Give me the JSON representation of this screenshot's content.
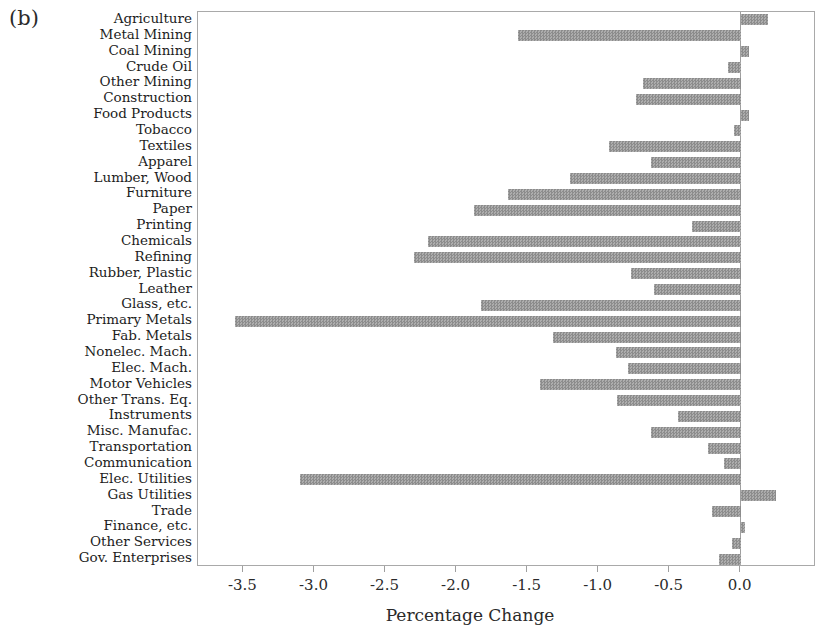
{
  "panel_label": "(b)",
  "chart_data": {
    "type": "bar",
    "orientation": "horizontal",
    "title": "",
    "xlabel": "Percentage Change",
    "ylabel": "",
    "xlim": [
      -3.82,
      0.53
    ],
    "grid": false,
    "legend": "none",
    "categories": [
      "Agriculture",
      "Metal Mining",
      "Coal Mining",
      "Crude Oil",
      "Other Mining",
      "Construction",
      "Food Products",
      "Tobacco",
      "Textiles",
      "Apparel",
      "Lumber, Wood",
      "Furniture",
      "Paper",
      "Printing",
      "Chemicals",
      "Refining",
      "Rubber, Plastic",
      "Leather",
      "Glass, etc.",
      "Primary Metals",
      "Fab. Metals",
      "Nonelec. Mach.",
      "Elec. Mach.",
      "Motor Vehicles",
      "Other Trans. Eq.",
      "Instruments",
      "Misc. Manufac.",
      "Transportation",
      "Communication",
      "Elec. Utilities",
      "Gas Utilities",
      "Trade",
      "Finance, etc.",
      "Other Services",
      "Gov. Enterprises"
    ],
    "values": [
      0.19,
      -1.57,
      0.06,
      -0.09,
      -0.69,
      -0.74,
      0.06,
      -0.05,
      -0.93,
      -0.63,
      -1.2,
      -1.64,
      -1.88,
      -0.34,
      -2.2,
      -2.3,
      -0.77,
      -0.61,
      -1.83,
      -3.56,
      -1.32,
      -0.88,
      -0.79,
      -1.41,
      -0.87,
      -0.44,
      -0.63,
      -0.23,
      -0.12,
      -3.1,
      0.25,
      -0.2,
      0.03,
      -0.06,
      -0.15
    ],
    "x_ticks": [
      -3.5,
      -3.0,
      -2.5,
      -2.0,
      -1.5,
      -1.0,
      -0.5,
      0.0
    ],
    "x_tick_labels": [
      "-3.5",
      "-3.0",
      "-2.5",
      "-2.0",
      "-1.5",
      "-1.0",
      "-0.5",
      "0.0"
    ],
    "bar_color": "#9a9a9a",
    "bar_pattern_dark": "#8c8c8c",
    "bar_pattern_light": "#adadad",
    "frame_color": "#a9a9a9",
    "text_color": "#1c1c1c"
  }
}
